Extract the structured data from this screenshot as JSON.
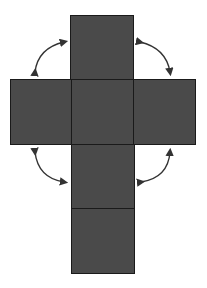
{
  "diagram": {
    "type": "cube-net",
    "colors": {
      "face": "#4a4a4a",
      "edge": "#1a1a1a",
      "arrow": "#333333",
      "background": "#ffffff"
    },
    "faces": [
      {
        "id": "top",
        "x": 70,
        "y": 15,
        "w": 63,
        "h": 64
      },
      {
        "id": "left",
        "x": 10,
        "y": 80,
        "w": 62,
        "h": 65
      },
      {
        "id": "center",
        "x": 71,
        "y": 80,
        "w": 63,
        "h": 65
      },
      {
        "id": "right",
        "x": 133,
        "y": 80,
        "w": 63,
        "h": 65
      },
      {
        "id": "lower",
        "x": 71,
        "y": 144,
        "w": 64,
        "h": 65
      },
      {
        "id": "bottom",
        "x": 71,
        "y": 208,
        "w": 64,
        "h": 65
      }
    ],
    "arrows": [
      {
        "id": "fold-top-left",
        "description": "double-headed curved arrow between top face and left face"
      },
      {
        "id": "fold-top-right",
        "description": "double-headed curved arrow between top face and right face"
      },
      {
        "id": "fold-lower-left",
        "description": "double-headed curved arrow between left face and lower face"
      },
      {
        "id": "fold-lower-right",
        "description": "double-headed curved arrow between right face and lower face"
      }
    ]
  }
}
